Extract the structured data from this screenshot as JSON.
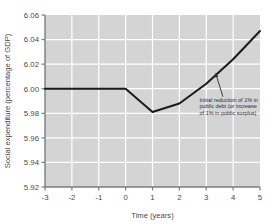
{
  "chart_data": {
    "type": "line",
    "title": "",
    "xlabel": "Time (years)",
    "ylabel": "Social expenditure (percentage of GDP)",
    "xlim": [
      -3,
      5
    ],
    "ylim": [
      5.92,
      6.06
    ],
    "xticks": [
      -3,
      -2,
      -1,
      0,
      1,
      2,
      3,
      4,
      5
    ],
    "xtick_labels": [
      "-3",
      "-2",
      "-1",
      "0",
      "1",
      "2",
      "3",
      "4",
      "5"
    ],
    "yticks": [
      5.92,
      5.94,
      5.96,
      5.98,
      6.0,
      6.02,
      6.04,
      6.06
    ],
    "ytick_labels": [
      "5.92",
      "5.94",
      "5.96",
      "5.98",
      "6.00",
      "6.02",
      "6.04",
      "6.06"
    ],
    "grid": true,
    "grid_color": "#ffffff",
    "plot_background": "#d4d4d4",
    "legend": false,
    "legend_position": "none",
    "series": [
      {
        "name": "Social expenditure",
        "color": "#1a1a1a",
        "line_width": 2,
        "x": [
          -3,
          -2,
          -1,
          0,
          1,
          2,
          3,
          4,
          5
        ],
        "values": [
          6.0,
          6.0,
          6.0,
          6.0,
          5.981,
          5.988,
          6.004,
          6.024,
          6.047
        ]
      }
    ],
    "annotations": [
      {
        "text_lines": [
          "Initial reduction of 1% in",
          "public debt (or increase",
          "of 1% in public surplus)"
        ],
        "text_x": 2.75,
        "text_y": 5.9895,
        "arrow_tail_x": 3.62,
        "arrow_tail_y": 5.9935,
        "arrow_head_x": 3.35,
        "arrow_head_y": 6.0125,
        "color": "#2b2b2b"
      }
    ]
  },
  "axis": {
    "xlabel": "Time (years)",
    "ylabel": "Social expenditure (percentage of GDP)"
  }
}
